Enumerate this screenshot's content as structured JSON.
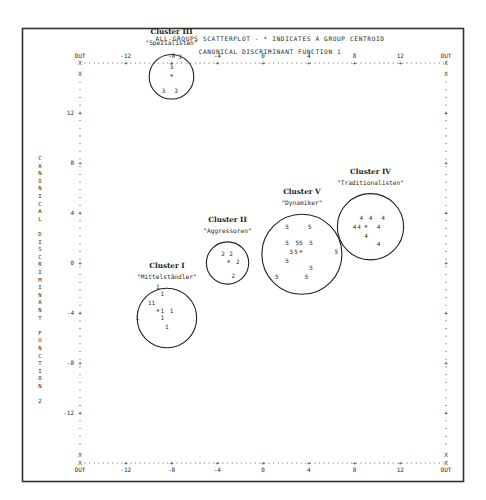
{
  "chart_data": {
    "type": "scatter",
    "title": "ALL-GROUPS SCATTERPLOT - * INDICATES A GROUP CENTROID",
    "xlabel": "CANONICAL DISCRIMINANT FUNCTION 1",
    "ylabel": "CANONICAL DISCRIMINANT FUNCTION 2",
    "xlim": [
      -16,
      16
    ],
    "ylim": [
      -16,
      16
    ],
    "grid": false,
    "x_ticks": [
      -12,
      -8,
      -4,
      0,
      4,
      8,
      12
    ],
    "y_ticks": [
      12,
      8,
      4,
      0,
      -4,
      -8,
      -12
    ],
    "x_tick_labels": [
      "OUT",
      "-12",
      "-8",
      "-4",
      "0",
      "4",
      "8",
      "12",
      "OUT"
    ],
    "y_tick_labels": [
      "12",
      "8",
      "4",
      "0",
      "-4",
      "-8",
      "-12"
    ],
    "out_label": "OUT",
    "centroid_symbol": "*",
    "series": [
      {
        "name": "Cluster I",
        "nickname": "\"Mittelständler\"",
        "symbol": "1",
        "centroid": [
          -9.2,
          -3.8
        ],
        "circle_radius_units": 2.6,
        "circle_center": [
          -8.4,
          -4.4
        ],
        "points": [
          [
            -9.2,
            -1.9
          ],
          [
            -8.8,
            -2.5
          ],
          [
            -9.9,
            -3.2
          ],
          [
            -9.6,
            -3.2
          ],
          [
            -8.8,
            -3.8
          ],
          [
            -8.0,
            -3.8
          ],
          [
            -11.0,
            -4.4
          ],
          [
            -8.8,
            -4.4
          ],
          [
            -8.4,
            -5.1
          ]
        ]
      },
      {
        "name": "Cluster II",
        "nickname": "\"Aggressoren\"",
        "symbol": "2",
        "centroid": [
          -3.0,
          0.1
        ],
        "circle_radius_units": 1.85,
        "circle_center": [
          -3.1,
          0.0
        ],
        "points": [
          [
            -3.5,
            0.7
          ],
          [
            -2.8,
            0.7
          ],
          [
            -2.2,
            0.1
          ],
          [
            -2.6,
            -1.0
          ]
        ]
      },
      {
        "name": "Cluster III",
        "nickname": "\"Spezialisten\"",
        "symbol": "3",
        "centroid": [
          -8.0,
          15.0
        ],
        "circle_radius_units": 1.95,
        "circle_center": [
          -8.0,
          14.9
        ],
        "points": [
          [
            -7.25,
            16.45
          ],
          [
            -8.0,
            15.7
          ],
          [
            -8.7,
            13.8
          ],
          [
            -7.6,
            13.8
          ]
        ]
      },
      {
        "name": "Cluster IV",
        "nickname": "\"Traditionalisten\"",
        "symbol": "4",
        "centroid": [
          9.0,
          2.9
        ],
        "circle_radius_units": 2.9,
        "circle_center": [
          9.4,
          2.9
        ],
        "points": [
          [
            8.6,
            3.6
          ],
          [
            9.4,
            3.6
          ],
          [
            10.5,
            3.6
          ],
          [
            8.0,
            2.9
          ],
          [
            8.4,
            2.9
          ],
          [
            10.1,
            2.9
          ],
          [
            9.0,
            2.2
          ],
          [
            10.1,
            1.5
          ]
        ]
      },
      {
        "name": "Cluster V",
        "nickname": "\"Dynamiker\"",
        "symbol": "5",
        "centroid": [
          3.3,
          0.9
        ],
        "circle_radius_units": 3.5,
        "circle_center": [
          3.4,
          0.7
        ],
        "points": [
          [
            2.1,
            2.9
          ],
          [
            4.1,
            2.9
          ],
          [
            2.1,
            1.6
          ],
          [
            3.0,
            1.6
          ],
          [
            3.3,
            1.6
          ],
          [
            4.2,
            1.6
          ],
          [
            2.5,
            0.9
          ],
          [
            2.9,
            0.9
          ],
          [
            6.4,
            0.9
          ],
          [
            2.1,
            0.2
          ],
          [
            4.2,
            -0.4
          ],
          [
            1.2,
            -1.1
          ],
          [
            3.8,
            -1.1
          ]
        ]
      }
    ]
  }
}
